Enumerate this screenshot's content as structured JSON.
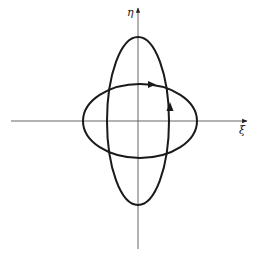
{
  "diagram": {
    "axes": {
      "horizontal": {
        "label": "ξ",
        "x1": 11,
        "x2": 247,
        "y": 121
      },
      "vertical": {
        "label": "η",
        "x": 138,
        "y1": 249,
        "y2": 8
      }
    },
    "curves": [
      {
        "name": "tall-ellipse",
        "cx": 138,
        "cy": 121,
        "rx": 31,
        "ry": 84,
        "direction_arrow": "up",
        "arrow_at": [
          170,
          108
        ]
      },
      {
        "name": "wide-ellipse",
        "cx": 140,
        "cy": 121,
        "rx": 57,
        "ry": 37,
        "direction_arrow": "right",
        "arrow_at": [
          152,
          84
        ]
      }
    ],
    "colors": {
      "curve": "#1a1a1a",
      "axis": "#555555",
      "background": "#ffffff"
    }
  }
}
